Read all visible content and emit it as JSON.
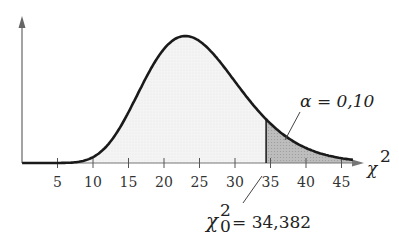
{
  "chart_data": {
    "type": "area",
    "title": "",
    "distribution": "chi-square",
    "degrees_of_freedom": 25,
    "xlabel": "χ²",
    "ylabel": "",
    "xlim": [
      0,
      48
    ],
    "x_ticks": [
      5,
      10,
      15,
      20,
      25,
      30,
      35,
      40,
      45
    ],
    "x_tick_labels": [
      "5",
      "10",
      "15",
      "20",
      "25",
      "30",
      "35",
      "40",
      "45"
    ],
    "critical_value": 34.382,
    "critical_label": "χ₀² = 34,382",
    "alpha": 0.1,
    "alpha_label": "α = 0,10",
    "shaded_region": "right tail, x ≥ 34.382",
    "grid": false,
    "legend": "none"
  },
  "labels": {
    "axis_symbol": "χ",
    "axis_sup": "2",
    "alpha_text": "α = 0,10",
    "crit_symbol": "χ",
    "crit_sup": "2",
    "crit_sub": "0",
    "crit_value_text": "= 34,382"
  },
  "colors": {
    "curve": "#1a1a1a",
    "body_fill": "#f3f3f3",
    "tail_fill": "#b8b8b8",
    "axis": "#555555"
  }
}
